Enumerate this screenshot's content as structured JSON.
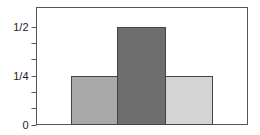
{
  "chart_data": {
    "type": "bar",
    "title": "",
    "xlabel": "",
    "ylabel": "",
    "categories": [
      "bar-1",
      "bar-2",
      "bar-3"
    ],
    "values": [
      0.25,
      0.5,
      0.25
    ],
    "colors": [
      "#a9a9a9",
      "#6e6e6e",
      "#d4d4d4"
    ],
    "ylim": [
      0,
      0.5833
    ],
    "yticks": [
      {
        "value": 0,
        "label": "0"
      },
      {
        "value": 0.25,
        "label": "1/4"
      },
      {
        "value": 0.5,
        "label": "1/2"
      }
    ],
    "minor_tick_step": 0.08333,
    "grid": false,
    "legend": null,
    "frame": true
  },
  "style": {
    "frame_color": "#555555",
    "bar_edge_color": "#444444",
    "tick_color": "#555555"
  }
}
